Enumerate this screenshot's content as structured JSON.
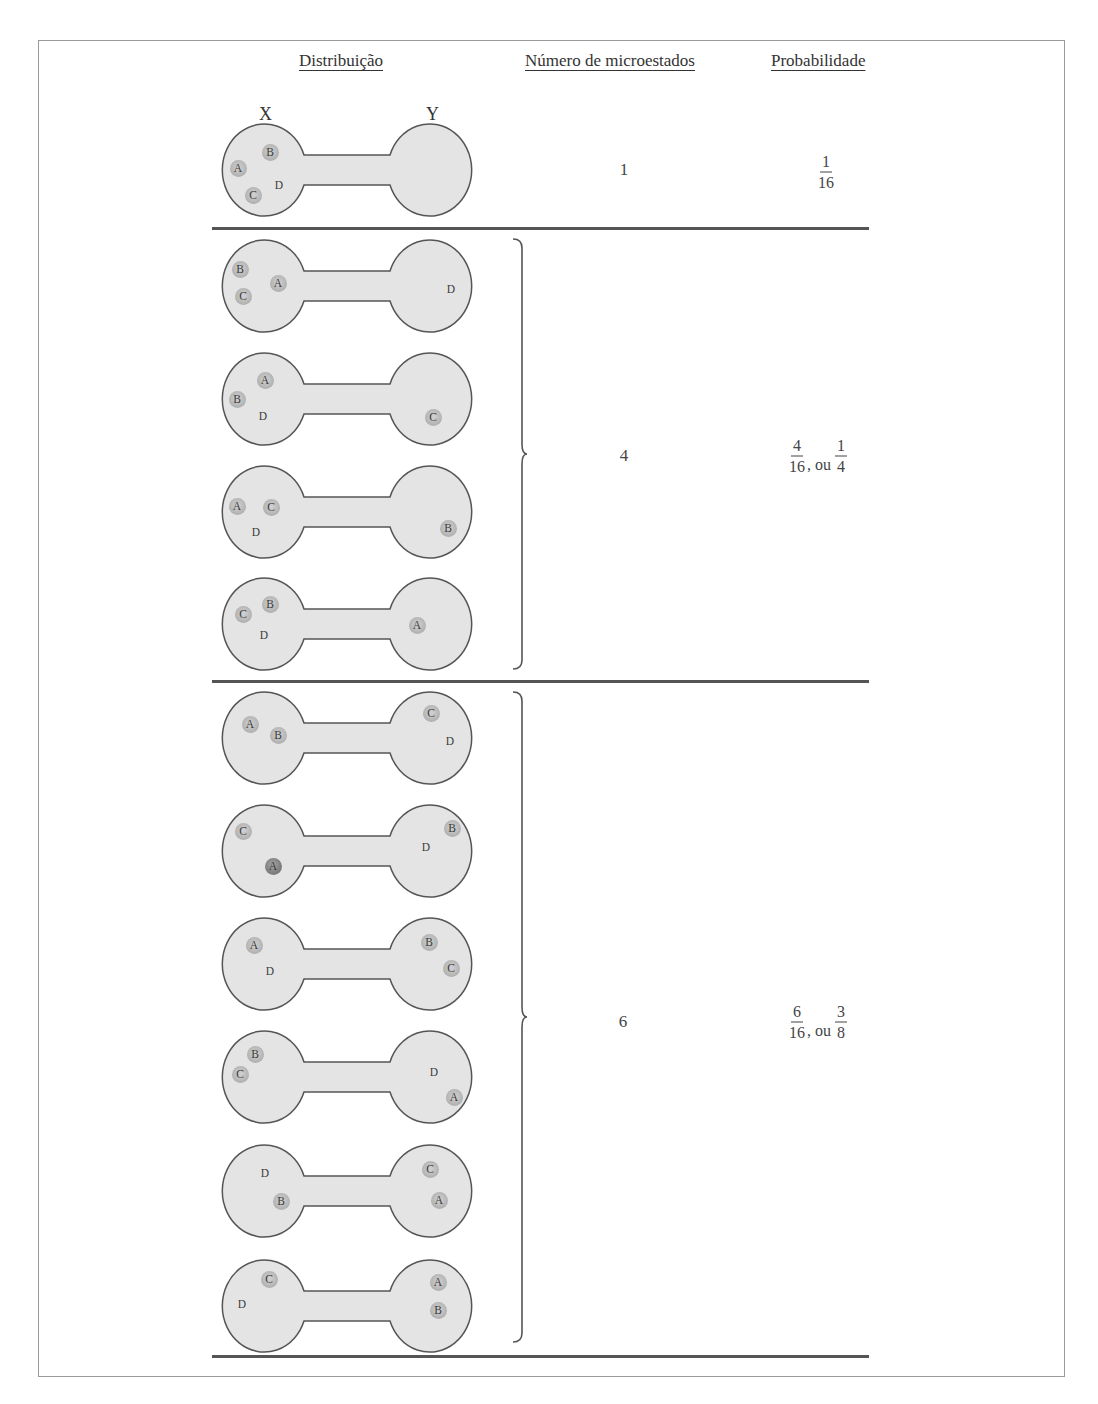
{
  "headers": {
    "distribution": "Distribuição",
    "microstates": "Número de microestados",
    "probability": "Probabilidade"
  },
  "bulb_labels": {
    "left": "X",
    "right": "Y"
  },
  "groups": [
    {
      "microstates": "1",
      "probability": {
        "n1": "1",
        "d1": "16",
        "sep": "",
        "n2": "",
        "d2": ""
      },
      "distributions": [
        {
          "left": [
            {
              "l": "A",
              "x": 18,
              "y": 48
            },
            {
              "l": "B",
              "x": 50,
              "y": 32
            },
            {
              "l": "C",
              "x": 33,
              "y": 75
            },
            {
              "l": "D",
              "x": 59,
              "y": 65,
              "plain": true
            }
          ],
          "right": []
        }
      ]
    },
    {
      "microstates": "4",
      "probability": {
        "n1": "4",
        "d1": "16",
        "sep": ", ou",
        "n2": "1",
        "d2": "4"
      },
      "distributions": [
        {
          "left": [
            {
              "l": "B",
              "x": 20,
              "y": 33
            },
            {
              "l": "A",
              "x": 58,
              "y": 47
            },
            {
              "l": "C",
              "x": 23,
              "y": 60
            }
          ],
          "right": [
            {
              "l": "D",
              "x": 231,
              "y": 53,
              "plain": true
            }
          ]
        },
        {
          "left": [
            {
              "l": "A",
              "x": 45,
              "y": 31
            },
            {
              "l": "B",
              "x": 17,
              "y": 50
            },
            {
              "l": "D",
              "x": 43,
              "y": 67,
              "plain": true
            }
          ],
          "right": [
            {
              "l": "C",
              "x": 213,
              "y": 68
            }
          ]
        },
        {
          "left": [
            {
              "l": "A",
              "x": 17,
              "y": 44
            },
            {
              "l": "C",
              "x": 51,
              "y": 45
            },
            {
              "l": "D",
              "x": 36,
              "y": 70,
              "plain": true
            }
          ],
          "right": [
            {
              "l": "B",
              "x": 228,
              "y": 66
            }
          ]
        },
        {
          "left": [
            {
              "l": "B",
              "x": 50,
              "y": 30
            },
            {
              "l": "C",
              "x": 23,
              "y": 40
            },
            {
              "l": "D",
              "x": 44,
              "y": 61,
              "plain": true
            }
          ],
          "right": [
            {
              "l": "A",
              "x": 197,
              "y": 51
            }
          ]
        }
      ]
    },
    {
      "microstates": "6",
      "probability": {
        "n1": "6",
        "d1": "16",
        "sep": ", ou",
        "n2": "3",
        "d2": "8"
      },
      "distributions": [
        {
          "left": [
            {
              "l": "A",
              "x": 30,
              "y": 36
            },
            {
              "l": "B",
              "x": 58,
              "y": 47
            }
          ],
          "right": [
            {
              "l": "C",
              "x": 211,
              "y": 25
            },
            {
              "l": "D",
              "x": 230,
              "y": 53,
              "plain": true
            }
          ]
        },
        {
          "left": [
            {
              "l": "C",
              "x": 23,
              "y": 30
            },
            {
              "l": "A",
              "x": 53,
              "y": 65,
              "dark": true
            }
          ],
          "right": [
            {
              "l": "B",
              "x": 232,
              "y": 27
            },
            {
              "l": "D",
              "x": 206,
              "y": 46,
              "plain": true
            }
          ]
        },
        {
          "left": [
            {
              "l": "A",
              "x": 34,
              "y": 31
            },
            {
              "l": "D",
              "x": 50,
              "y": 57,
              "plain": true
            }
          ],
          "right": [
            {
              "l": "B",
              "x": 209,
              "y": 28
            },
            {
              "l": "C",
              "x": 231,
              "y": 54
            }
          ]
        },
        {
          "left": [
            {
              "l": "B",
              "x": 35,
              "y": 27
            },
            {
              "l": "C",
              "x": 20,
              "y": 47
            }
          ],
          "right": [
            {
              "l": "D",
              "x": 214,
              "y": 45,
              "plain": true
            },
            {
              "l": "A",
              "x": 234,
              "y": 70
            }
          ]
        },
        {
          "left": [
            {
              "l": "D",
              "x": 45,
              "y": 32,
              "plain": true
            },
            {
              "l": "B",
              "x": 61,
              "y": 60
            }
          ],
          "right": [
            {
              "l": "C",
              "x": 210,
              "y": 28
            },
            {
              "l": "A",
              "x": 219,
              "y": 59
            }
          ]
        },
        {
          "left": [
            {
              "l": "C",
              "x": 49,
              "y": 23
            },
            {
              "l": "D",
              "x": 22,
              "y": 48,
              "plain": true
            }
          ],
          "right": [
            {
              "l": "A",
              "x": 218,
              "y": 26
            },
            {
              "l": "B",
              "x": 218,
              "y": 54
            }
          ]
        }
      ]
    }
  ]
}
